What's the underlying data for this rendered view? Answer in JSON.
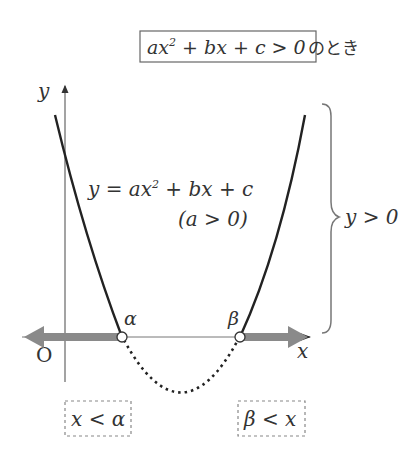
{
  "title": {
    "expr": "ax",
    "sup": "2",
    "rest": " + bx + c > 0",
    "suffix": "のとき"
  },
  "axes": {
    "y_label": "y",
    "x_label": "x",
    "origin_label": "O"
  },
  "curve": {
    "equation_y": "y = ax",
    "equation_sup": "2",
    "equation_rest": " + bx + c",
    "condition": "(a > 0)"
  },
  "roots": {
    "alpha": "α",
    "beta": "β"
  },
  "brace_label": "y > 0",
  "solutions": {
    "left": "x < α",
    "right": "β < x"
  },
  "colors": {
    "curve": "#222222",
    "axis": "#555555",
    "arrow": "#8a8a8a",
    "dashed_box": "#888888"
  }
}
